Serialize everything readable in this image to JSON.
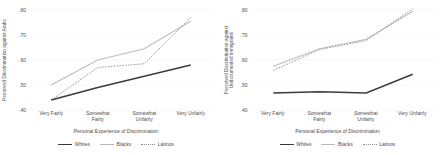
{
  "chart_data": [
    {
      "type": "line",
      "title": "",
      "panel": "left",
      "ylabel": "Perceived Discrimination against Arabs",
      "xlabel": "Personal Experience of Discrimination",
      "categories": [
        "Very Fairly",
        "Somewhat\nFairly",
        "Somewhat\nUnfairly",
        "Very Unfairly"
      ],
      "ylim": [
        0.4,
        0.8
      ],
      "yticks": [
        ".40",
        ".50",
        ".60",
        ".70",
        ".80"
      ],
      "ytick_values": [
        0.4,
        0.5,
        0.6,
        0.7,
        0.8
      ],
      "grid": true,
      "legend_position": "bottom",
      "series": [
        {
          "name": "Whites",
          "values": [
            0.44,
            0.49,
            0.535,
            0.58
          ]
        },
        {
          "name": "Blacks",
          "values": [
            0.5,
            0.6,
            0.645,
            0.755
          ]
        },
        {
          "name": "Latinos",
          "values": [
            0.44,
            0.57,
            0.585,
            0.77
          ]
        }
      ]
    },
    {
      "type": "line",
      "title": "",
      "panel": "right",
      "ylabel": "Perceived Discrimination against\nUndocumented Immigrants",
      "xlabel": "Personal Experience of Discrimination",
      "categories": [
        "Very Fairly",
        "Somewhat\nFairly",
        "Somewhat\nUnfairly",
        "Very Unfairly"
      ],
      "ylim": [
        0.4,
        0.8
      ],
      "yticks": [
        ".40",
        ".50",
        ".60",
        ".70",
        ".80"
      ],
      "ytick_values": [
        0.4,
        0.5,
        0.6,
        0.7,
        0.8
      ],
      "grid": true,
      "legend_position": "bottom",
      "series": [
        {
          "name": "Whites",
          "values": [
            0.468,
            0.473,
            0.468,
            0.543
          ]
        },
        {
          "name": "Blacks",
          "values": [
            0.575,
            0.645,
            0.683,
            0.795
          ]
        },
        {
          "name": "Latinos",
          "values": [
            0.558,
            0.642,
            0.678,
            0.805
          ]
        }
      ]
    }
  ],
  "legend": {
    "items": [
      {
        "label": "Whites"
      },
      {
        "label": "Blacks"
      },
      {
        "label": "Latinos"
      }
    ]
  },
  "colors": {
    "whites": "#3b3b3b",
    "blacks": "#bdbdbd",
    "latinos": "#9a9a9a",
    "grid": "#ededed",
    "text": "#4d4d4d"
  }
}
